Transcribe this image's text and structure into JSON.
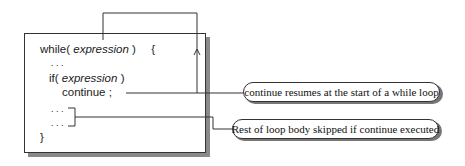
{
  "code": {
    "while_kw": "while(",
    "while_expr": "expression",
    "while_close": ")",
    "brace_open": "{",
    "ellipsis_1": ". . .",
    "if_kw": "if(",
    "if_expr": "expression",
    "if_close": ")",
    "continue_stmt": "continue ;",
    "ellipsis_2": ". . .",
    "ellipsis_3": ". . .",
    "brace_close": "}"
  },
  "callouts": [
    {
      "text": "continue resumes at the start of a while loop"
    },
    {
      "text": "Rest of loop body skipped if continue executed"
    }
  ]
}
